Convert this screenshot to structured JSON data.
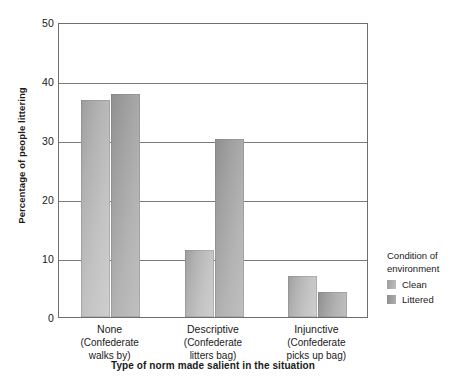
{
  "chart_data": {
    "type": "bar",
    "title": "",
    "xlabel": "Type of norm made salient in the situation",
    "ylabel": "Percentage of people littering",
    "ylim": [
      0,
      50
    ],
    "yticks": [
      0,
      10,
      20,
      30,
      40,
      50
    ],
    "grid": true,
    "legend_position": "right",
    "categories": [
      "None",
      "Descriptive",
      "Injunctive"
    ],
    "category_sublabels": [
      [
        "(Confederate",
        "walks by)"
      ],
      [
        "(Confederate",
        "litters bag)"
      ],
      [
        "(Confederate",
        "picks up bag)"
      ]
    ],
    "series": [
      {
        "name": "Clean",
        "color": "#bdbdbd",
        "values": [
          36.8,
          11.3,
          7.0
        ]
      },
      {
        "name": "Littered",
        "color": "#a8a8a8",
        "values": [
          37.8,
          30.2,
          4.2
        ]
      }
    ]
  },
  "legend": {
    "title_line1": "Condition of",
    "title_line2": "environment",
    "items": [
      {
        "label": "Clean"
      },
      {
        "label": "Littered"
      }
    ]
  }
}
